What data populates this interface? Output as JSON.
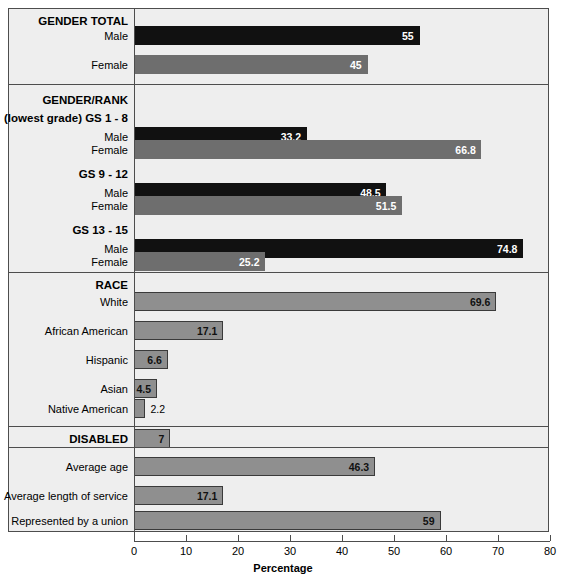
{
  "chart_data": {
    "type": "bar",
    "orientation": "horizontal",
    "title": "",
    "xlabel": "Percentage",
    "ylabel": "",
    "xlim": [
      0,
      80
    ],
    "xticks": [
      0,
      10,
      20,
      30,
      40,
      50,
      60,
      70,
      80
    ],
    "grid": false,
    "legend": null,
    "colors": {
      "male_bar": "#111111",
      "female_bar": "#6e6e6e",
      "plain_bar": "#8f8f8f",
      "panel_background": "#eeeeee",
      "frame": "#4d4d4d"
    },
    "sections": [
      {
        "heading": "GENDER TOTAL",
        "rows": [
          {
            "label": "Male",
            "value": 55,
            "value_text": "55",
            "style": "dark",
            "label_position": "inside"
          },
          {
            "label": "Female",
            "value": 45,
            "value_text": "45",
            "style": "mid",
            "label_position": "inside"
          }
        ]
      },
      {
        "heading": "GENDER/RANK",
        "subheading": "(lowest grade) GS 1 - 8",
        "rows": [
          {
            "label": "Male",
            "value": 33.2,
            "value_text": "33.2",
            "style": "dark",
            "label_position": "inside"
          },
          {
            "label": "Female",
            "value": 66.8,
            "value_text": "66.8",
            "style": "mid",
            "label_position": "inside"
          },
          {
            "label": "GS 9 - 12",
            "heading": true
          },
          {
            "label": "Male",
            "value": 48.5,
            "value_text": "48.5",
            "style": "dark",
            "label_position": "inside"
          },
          {
            "label": "Female",
            "value": 51.5,
            "value_text": "51.5",
            "style": "mid",
            "label_position": "inside"
          },
          {
            "label": "GS 13 - 15",
            "heading": true
          },
          {
            "label": "Male",
            "value": 74.8,
            "value_text": "74.8",
            "style": "dark",
            "label_position": "inside"
          },
          {
            "label": "Female",
            "value": 25.2,
            "value_text": "25.2",
            "style": "mid",
            "label_position": "inside"
          }
        ]
      },
      {
        "heading": "RACE",
        "rows": [
          {
            "label": "White",
            "value": 69.6,
            "value_text": "69.6",
            "style": "light",
            "label_position": "inside"
          },
          {
            "label": "African American",
            "value": 17.1,
            "value_text": "17.1",
            "style": "light",
            "label_position": "inside"
          },
          {
            "label": "Hispanic",
            "value": 6.6,
            "value_text": "6.6",
            "style": "light",
            "label_position": "inside"
          },
          {
            "label": "Asian",
            "value": 4.5,
            "value_text": "4.5",
            "style": "light",
            "label_position": "inside"
          },
          {
            "label": "Native American",
            "value": 2.2,
            "value_text": "2.2",
            "style": "light",
            "label_position": "outside"
          }
        ]
      },
      {
        "heading": "DISABLED",
        "inline_value": 7,
        "inline_value_text": "7",
        "rows": []
      },
      {
        "heading": "",
        "rows": [
          {
            "label": "Average age",
            "value": 46.3,
            "value_text": "46.3",
            "style": "light",
            "label_position": "inside"
          },
          {
            "label": "Average length of service",
            "value": 17.1,
            "value_text": "17.1",
            "style": "light",
            "label_position": "inside"
          },
          {
            "label": "Represented by a union",
            "value": 59,
            "value_text": "59",
            "style": "light",
            "label_position": "inside"
          }
        ]
      }
    ]
  },
  "labels": {
    "gender_total": "GENDER TOTAL",
    "gender_total_male": "Male",
    "gender_total_female": "Female",
    "gender_rank": "GENDER/RANK",
    "gs_1_8": "(lowest grade) GS 1 - 8",
    "gs_1_8_male": "Male",
    "gs_1_8_female": "Female",
    "gs_9_12": "GS 9 - 12",
    "gs_9_12_male": "Male",
    "gs_9_12_female": "Female",
    "gs_13_15": "GS 13 - 15",
    "gs_13_15_male": "Male",
    "gs_13_15_female": "Female",
    "race": "RACE",
    "race_white": "White",
    "race_african_american": "African American",
    "race_hispanic": "Hispanic",
    "race_asian": "Asian",
    "race_native_american": "Native American",
    "disabled": "DISABLED",
    "average_age": "Average age",
    "average_length_of_service": "Average length of service",
    "represented_by_a_union": "Represented by a union"
  },
  "values": {
    "gender_total_male": "55",
    "gender_total_female": "45",
    "gs_1_8_male": "33.2",
    "gs_1_8_female": "66.8",
    "gs_9_12_male": "48.5",
    "gs_9_12_female": "51.5",
    "gs_13_15_male": "74.8",
    "gs_13_15_female": "25.2",
    "race_white": "69.6",
    "race_african_american": "17.1",
    "race_hispanic": "6.6",
    "race_asian": "4.5",
    "race_native_american": "2.2",
    "disabled": "7",
    "average_age": "46.3",
    "average_length_of_service": "17.1",
    "represented_by_a_union": "59"
  },
  "axis": {
    "title": "Percentage",
    "ticks": [
      "0",
      "10",
      "20",
      "30",
      "40",
      "50",
      "60",
      "70",
      "80"
    ]
  }
}
